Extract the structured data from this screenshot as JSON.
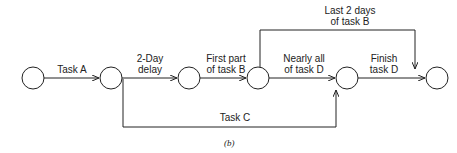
{
  "diagram": {
    "nodes": [
      {
        "id": "n1",
        "cx": 33,
        "cy": 78
      },
      {
        "id": "n2",
        "cx": 111,
        "cy": 78
      },
      {
        "id": "n3",
        "cx": 189,
        "cy": 78
      },
      {
        "id": "n4",
        "cx": 258,
        "cy": 78
      },
      {
        "id": "n5",
        "cx": 347,
        "cy": 78
      },
      {
        "id": "n6",
        "cx": 437,
        "cy": 78
      }
    ],
    "edges": {
      "task_a": {
        "line1": "Task A"
      },
      "delay": {
        "line1": "2-Day",
        "line2": "delay"
      },
      "first_b": {
        "line1": "First part",
        "line2": "of task B"
      },
      "nearly_d": {
        "line1": "Nearly all",
        "line2": "of task D"
      },
      "finish_d": {
        "line1": "Finish",
        "line2": "task D"
      },
      "last_b": {
        "line1": "Last 2 days",
        "line2": "of task B"
      },
      "task_c": {
        "line1": "Task C"
      }
    },
    "caption": "(b)"
  }
}
